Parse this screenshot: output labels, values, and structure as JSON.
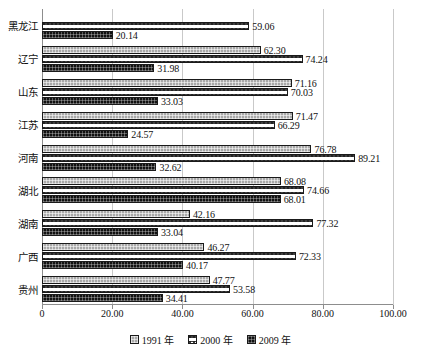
{
  "chart_data": {
    "type": "bar",
    "orientation": "horizontal",
    "title": "",
    "xlabel": "",
    "ylabel": "",
    "xlim": [
      0,
      100
    ],
    "xticks": [
      "0",
      "20.00",
      "40.00",
      "60.00",
      "80.00",
      "100.00"
    ],
    "xtick_values": [
      0,
      20,
      40,
      60,
      80,
      100
    ],
    "grid": true,
    "legend_position": "bottom-center",
    "categories": [
      "黑龙江",
      "辽宁",
      "山东",
      "江苏",
      "河南",
      "湖北",
      "湖南",
      "广西",
      "贵州"
    ],
    "series": [
      {
        "name": "1991 年",
        "key": "s1991",
        "values": [
          null,
          62.3,
          71.16,
          71.47,
          76.78,
          68.08,
          42.16,
          46.27,
          47.77
        ],
        "labels": [
          "",
          "62.30",
          "71.16",
          "71.47",
          "76.78",
          "68.08",
          "42.16",
          "46.27",
          "47.77"
        ]
      },
      {
        "name": "2000 年",
        "key": "s2000",
        "values": [
          59.06,
          74.24,
          70.03,
          66.29,
          89.21,
          74.66,
          77.32,
          72.33,
          53.58
        ],
        "labels": [
          "59.06",
          "74.24",
          "70.03",
          "66.29",
          "89.21",
          "74.66",
          "77.32",
          "72.33",
          "53.58"
        ]
      },
      {
        "name": "2009 年",
        "key": "s2009",
        "values": [
          20.14,
          31.98,
          33.03,
          24.57,
          32.62,
          68.01,
          33.04,
          40.17,
          34.41
        ],
        "labels": [
          "20.14",
          "31.98",
          "33.03",
          "24.57",
          "32.62",
          "68.01",
          "33.04",
          "40.17",
          "34.41"
        ]
      }
    ],
    "colors": {
      "series_1991": "#a8a8a8",
      "series_2000": "#ffffff",
      "series_2009": "#111111",
      "gridline": "#c9c9c9",
      "axis": "#8d8d8d",
      "text": "#111111",
      "background": "#ffffff"
    }
  },
  "legend": {
    "items": [
      {
        "label": "1991 年"
      },
      {
        "label": "2000 年"
      },
      {
        "label": "2009 年"
      }
    ]
  }
}
